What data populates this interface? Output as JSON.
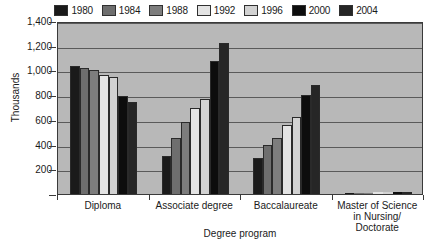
{
  "chart_data": {
    "type": "bar",
    "title": "",
    "xlabel": "Degree program",
    "ylabel": "Thousands",
    "ylim": [
      0,
      1400
    ],
    "ytick_values": [
      200,
      400,
      600,
      800,
      1000,
      1200,
      1400
    ],
    "ytick_labels": [
      "200",
      "400",
      "600",
      "800",
      "1,000",
      "1,200",
      "1,400"
    ],
    "grid": true,
    "legend_position": "top",
    "categories": [
      "Diploma",
      "Associate degree",
      "Baccalaureate",
      "Master of Science in Nursing/ Doctorate"
    ],
    "category_label_lines": [
      [
        "Diploma"
      ],
      [
        "Associate degree"
      ],
      [
        "Baccalaureate"
      ],
      [
        "Master of Science",
        "in Nursing/",
        "Doctorate"
      ]
    ],
    "series": [
      {
        "name": "1980",
        "color": "#1a1a1a",
        "values": [
          1040,
          305,
          290,
          10
        ]
      },
      {
        "name": "1984",
        "color": "#6e6e6e",
        "values": [
          1020,
          455,
          400,
          10
        ]
      },
      {
        "name": "1988",
        "color": "#7d7d7d",
        "values": [
          1000,
          580,
          450,
          12
        ]
      },
      {
        "name": "1992",
        "color": "#e3e3e3",
        "values": [
          960,
          700,
          560,
          14
        ]
      },
      {
        "name": "1996",
        "color": "#d2d2d2",
        "values": [
          950,
          770,
          620,
          16
        ]
      },
      {
        "name": "2000",
        "color": "#0d0d0d",
        "values": [
          790,
          1080,
          800,
          18
        ]
      },
      {
        "name": "2004",
        "color": "#262626",
        "values": [
          745,
          1220,
          880,
          20
        ]
      }
    ]
  }
}
